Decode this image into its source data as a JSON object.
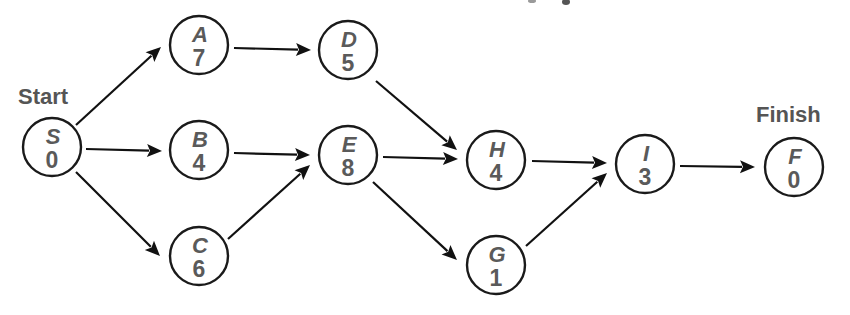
{
  "diagram": {
    "type": "activity-on-node network",
    "labels": {
      "start": {
        "text": "Start",
        "x": 18,
        "y": 104
      },
      "finish": {
        "text": "Finish",
        "x": 756,
        "y": 122
      }
    },
    "nodes": [
      {
        "id": "S",
        "letter": "S",
        "value": "0",
        "cx": 52,
        "cy": 147
      },
      {
        "id": "A",
        "letter": "A",
        "value": "7",
        "cx": 199,
        "cy": 45
      },
      {
        "id": "B",
        "letter": "B",
        "value": "4",
        "cx": 199,
        "cy": 150
      },
      {
        "id": "C",
        "letter": "C",
        "value": "6",
        "cx": 199,
        "cy": 256
      },
      {
        "id": "D",
        "letter": "D",
        "value": "5",
        "cx": 348,
        "cy": 50
      },
      {
        "id": "E",
        "letter": "E",
        "value": "8",
        "cx": 348,
        "cy": 155
      },
      {
        "id": "H",
        "letter": "H",
        "value": "4",
        "cx": 496,
        "cy": 160
      },
      {
        "id": "G",
        "letter": "G",
        "value": "1",
        "cx": 496,
        "cy": 265
      },
      {
        "id": "I",
        "letter": "I",
        "value": "3",
        "cx": 645,
        "cy": 164
      },
      {
        "id": "F",
        "letter": "F",
        "value": "0",
        "cx": 794,
        "cy": 167
      }
    ],
    "edges": [
      {
        "from": "S",
        "to": "A",
        "x1": 76,
        "y1": 125,
        "x2": 161,
        "y2": 47
      },
      {
        "from": "S",
        "to": "B",
        "x1": 86,
        "y1": 149,
        "x2": 162,
        "y2": 151
      },
      {
        "from": "S",
        "to": "C",
        "x1": 76,
        "y1": 172,
        "x2": 160,
        "y2": 256
      },
      {
        "from": "A",
        "to": "D",
        "x1": 234,
        "y1": 48,
        "x2": 311,
        "y2": 50
      },
      {
        "from": "B",
        "to": "E",
        "x1": 234,
        "y1": 153,
        "x2": 310,
        "y2": 155
      },
      {
        "from": "C",
        "to": "E",
        "x1": 228,
        "y1": 239,
        "x2": 310,
        "y2": 165
      },
      {
        "from": "D",
        "to": "H",
        "x1": 376,
        "y1": 81,
        "x2": 457,
        "y2": 150
      },
      {
        "from": "E",
        "to": "H",
        "x1": 383,
        "y1": 157,
        "x2": 458,
        "y2": 159
      },
      {
        "from": "E",
        "to": "G",
        "x1": 373,
        "y1": 182,
        "x2": 457,
        "y2": 260
      },
      {
        "from": "H",
        "to": "I",
        "x1": 532,
        "y1": 161,
        "x2": 607,
        "y2": 163
      },
      {
        "from": "G",
        "to": "I",
        "x1": 526,
        "y1": 246,
        "x2": 607,
        "y2": 173
      },
      {
        "from": "I",
        "to": "F",
        "x1": 680,
        "y1": 166,
        "x2": 755,
        "y2": 167
      }
    ],
    "node_radius": 29,
    "colors": {
      "stroke": "#1a1a1a",
      "text": "#5a5a5a",
      "label": "#555555",
      "background": "#ffffff"
    }
  }
}
